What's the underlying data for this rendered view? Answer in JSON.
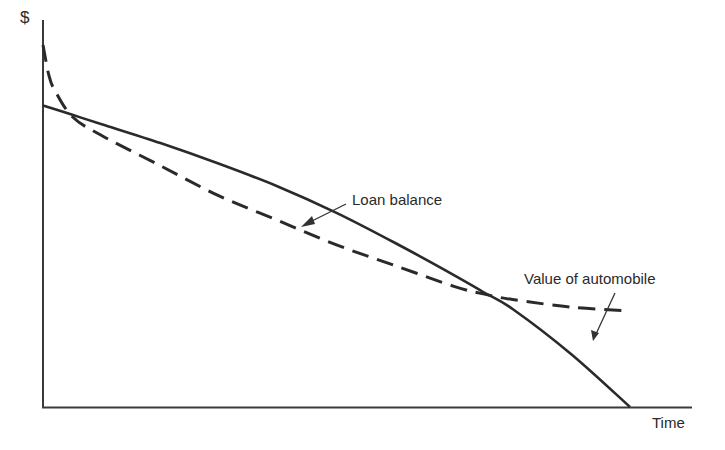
{
  "chart_data": {
    "type": "line",
    "title": "",
    "xlabel": "Time",
    "ylabel": "$",
    "grid": false,
    "legend": "none (curves labeled directly with arrows)",
    "x_ticks": [],
    "y_ticks": [],
    "xlim": [
      0,
      100
    ],
    "ylim": [
      0,
      100
    ],
    "series": [
      {
        "name": "Loan balance",
        "style": "solid",
        "x": [
          0,
          5,
          10,
          20,
          30,
          40,
          50,
          60,
          70,
          75,
          80,
          90,
          100
        ],
        "y": [
          80,
          77.5,
          75,
          70,
          64.5,
          58.5,
          51.5,
          43.5,
          35,
          30.5,
          26,
          14,
          0
        ]
      },
      {
        "name": "Value of automobile",
        "style": "dashed",
        "x": [
          0,
          1,
          2,
          5,
          10,
          20,
          30,
          40,
          50,
          60,
          70,
          75,
          80,
          90,
          100
        ],
        "y": [
          96,
          88,
          84,
          77,
          72,
          64,
          56,
          49.5,
          43,
          37.5,
          32,
          30,
          28.5,
          26.5,
          25.5
        ]
      }
    ],
    "annotations": [
      {
        "text": "Loan balance",
        "points_to": "Loan balance",
        "arrow": true
      },
      {
        "text": "Value of automobile",
        "points_to": "Value of automobile",
        "arrow": true
      }
    ],
    "intersections": [
      {
        "x": 5,
        "y": 77.5
      },
      {
        "x": 75,
        "y": 30.5
      }
    ]
  },
  "labels": {
    "y_axis": "$",
    "x_axis": "Time",
    "loan": "Loan balance",
    "auto": "Value of automobile"
  },
  "colors": {
    "ink": "#2a2a2a",
    "background": "#ffffff"
  }
}
